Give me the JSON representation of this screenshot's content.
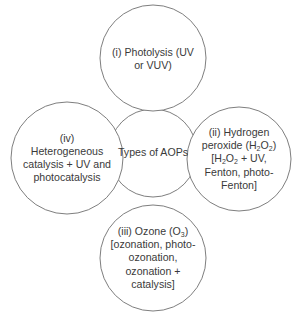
{
  "diagram": {
    "title": "Types of AOPs",
    "style": {
      "stroke_color": "#6f6f6f",
      "text_color": "#3a3a3a",
      "background": "#ffffff"
    },
    "center": {
      "label": "Types of AOPs"
    },
    "nodes": [
      {
        "id": "i",
        "position": "top",
        "lines": [
          "(i) Photolysis (UV",
          "or VUV)"
        ]
      },
      {
        "id": "ii",
        "position": "right",
        "lines": [
          "(ii) Hydrogen",
          "peroxide (H2O2)",
          "[H2O2 + UV,",
          "Fenton, photo-",
          "Fenton]"
        ]
      },
      {
        "id": "iii",
        "position": "bottom",
        "lines": [
          "(iii) Ozone (O3)",
          "[ozonation, photo-",
          "ozonation,",
          "ozonation +",
          "catalysis]"
        ]
      },
      {
        "id": "iv",
        "position": "left",
        "lines": [
          "(iv)",
          "Heterogeneous",
          "catalysis + UV and",
          "photocatalysis"
        ]
      }
    ]
  }
}
